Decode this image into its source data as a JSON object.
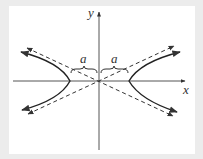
{
  "diagram": {
    "type": "hyperbola",
    "orientation": "horizontal transverse axis",
    "axes": {
      "x_label": "x",
      "y_label": "y"
    },
    "annotations": [
      {
        "label": "a",
        "description": "distance from center to left vertex"
      },
      {
        "label": "a",
        "description": "distance from center to right vertex"
      }
    ],
    "elements": {
      "branches": [
        "left branch",
        "right branch"
      ],
      "asymptotes": [
        "dashed asymptote y = (b/a)x",
        "dashed asymptote y = -(b/a)x"
      ]
    },
    "colors": {
      "curve": "#222222",
      "axis": "#444444",
      "background": "#ffffff",
      "frame": "#ececec"
    }
  }
}
